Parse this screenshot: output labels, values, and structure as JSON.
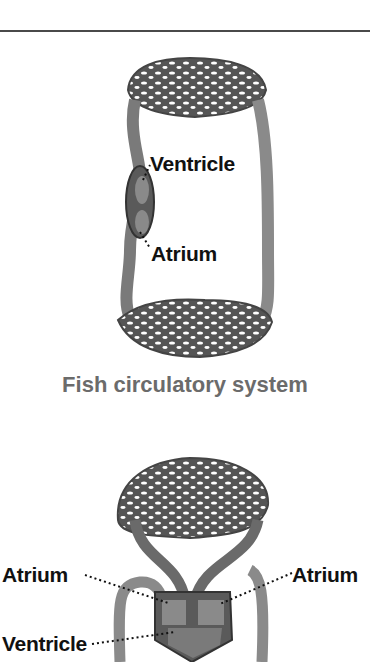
{
  "fish_diagram": {
    "labels": {
      "ventricle": "Ventricle",
      "atrium": "Atrium"
    },
    "caption": "Fish circulatory system"
  },
  "mammal_diagram": {
    "labels": {
      "atrium_left": "Atrium",
      "atrium_right": "Atrium",
      "ventricle": "Ventricle"
    }
  },
  "colors": {
    "vessel": "#7a7a7a",
    "vessel_dark": "#4a4a4a",
    "caption": "#6b6b6b",
    "label": "#111111"
  }
}
